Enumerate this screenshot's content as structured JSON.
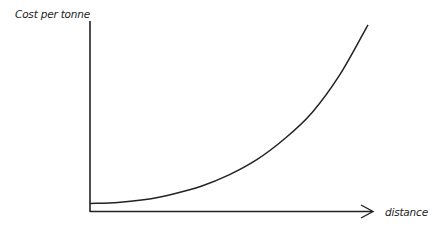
{
  "chart_data": {
    "type": "line",
    "title": "",
    "xlabel": "distance",
    "ylabel": "Cost per tonne",
    "grid": false,
    "legend": null,
    "axis_ticks": false,
    "series": [
      {
        "name": "cost per tonne",
        "x_relative": [
          0,
          0.1,
          0.2,
          0.3,
          0.4,
          0.5,
          0.6,
          0.7,
          0.8,
          0.9,
          1.0
        ],
        "y_relative": [
          0.04,
          0.045,
          0.06,
          0.09,
          0.13,
          0.19,
          0.27,
          0.38,
          0.52,
          0.72,
          0.98
        ]
      }
    ],
    "xlim": [
      0,
      1
    ],
    "ylim": [
      0,
      1
    ]
  },
  "labels": {
    "y_axis": "Cost per tonne",
    "x_axis": "distance"
  },
  "colors": {
    "axis": "#222222",
    "curve": "#222222"
  }
}
